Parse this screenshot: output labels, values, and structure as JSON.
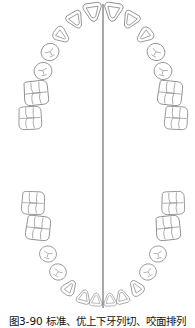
{
  "figure": {
    "caption": "图3-90 标准、优上下牙列切、咬面排列",
    "midline_x": 103,
    "stroke_color": "#808080",
    "midline_color": "#555555",
    "upper_arch": {
      "label": "upper dental arch",
      "teeth_per_side": 7
    },
    "lower_arch": {
      "label": "lower dental arch",
      "teeth_per_side": 7
    }
  }
}
